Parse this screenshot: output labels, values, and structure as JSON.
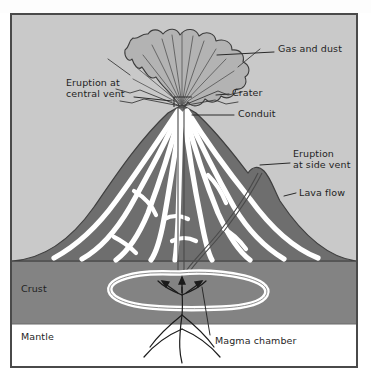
{
  "figure": {
    "type": "cross-section-diagram",
    "colors": {
      "sky": "#c9c9c9",
      "cone": "#6e6e6e",
      "lava": "#ffffff",
      "crust": "#838383",
      "mantle": "#ffffff",
      "ink": "#1f1f1f",
      "frame_border": "#4a4a4a",
      "plume_fill": "#b0b0b0"
    },
    "labels": [
      {
        "id": "gas-and-dust",
        "text": "Gas and dust",
        "lines": [
          "Gas and dust"
        ]
      },
      {
        "id": "eruption-at-central-vent",
        "text": "Eruption at central vent",
        "lines": [
          "Eruption at",
          "central vent"
        ]
      },
      {
        "id": "crater",
        "text": "Crater",
        "lines": [
          "Crater"
        ]
      },
      {
        "id": "conduit",
        "text": "Conduit",
        "lines": [
          "Conduit"
        ]
      },
      {
        "id": "eruption-at-side-vent",
        "text": "Eruption at side vent",
        "lines": [
          "Eruption",
          "at side vent"
        ]
      },
      {
        "id": "lava-flow",
        "text": "Lava flow",
        "lines": [
          "Lava flow"
        ]
      },
      {
        "id": "crust",
        "text": "Crust",
        "lines": [
          "Crust"
        ]
      },
      {
        "id": "mantle",
        "text": "Mantle",
        "lines": [
          "Mantle"
        ]
      },
      {
        "id": "magma-chamber",
        "text": "Magma chamber",
        "lines": [
          "Magma chamber"
        ]
      }
    ],
    "layers": [
      {
        "id": "sky",
        "name": "Sky / atmosphere"
      },
      {
        "id": "cone",
        "name": "Volcanic cone"
      },
      {
        "id": "crust",
        "name": "Crust"
      },
      {
        "id": "mantle",
        "name": "Mantle"
      }
    ]
  }
}
